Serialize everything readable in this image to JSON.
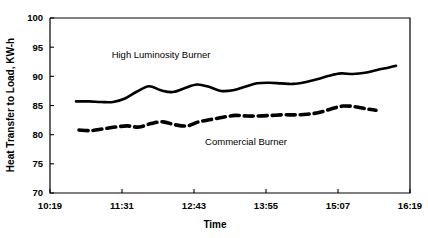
{
  "chart_data": {
    "type": "line",
    "title": "",
    "xlabel": "Time",
    "ylabel": "Heat Transfer to Load, KW-h",
    "ylim": [
      70,
      100
    ],
    "yticks": [
      70,
      75,
      80,
      85,
      90,
      95,
      100
    ],
    "ytick_labels": [
      "70",
      "75",
      "80",
      "85",
      "90",
      "95",
      "100"
    ],
    "xticks": [
      "10:19",
      "11:31",
      "12:43",
      "13:55",
      "15:07",
      "16:19"
    ],
    "xlim": [
      "10:19",
      "16:19"
    ],
    "grid": false,
    "legend_position": "inline-annotation",
    "series": [
      {
        "name": "High Luminosity Burner",
        "style": "solid",
        "color": "#000000",
        "label_x": "12:10",
        "label_y": 93.2,
        "x": [
          "10:45",
          "10:58",
          "11:10",
          "11:22",
          "11:34",
          "11:46",
          "11:58",
          "12:10",
          "12:22",
          "12:34",
          "12:46",
          "12:58",
          "13:10",
          "13:22",
          "13:34",
          "13:46",
          "13:58",
          "14:10",
          "14:22",
          "14:34",
          "14:46",
          "14:58",
          "15:10",
          "15:22",
          "15:34",
          "15:46",
          "15:58",
          "16:05"
        ],
        "values": [
          85.7,
          85.7,
          85.6,
          85.6,
          86.2,
          87.4,
          88.3,
          87.6,
          87.3,
          88.0,
          88.6,
          88.2,
          87.5,
          87.6,
          88.2,
          88.8,
          88.9,
          88.8,
          88.7,
          89.0,
          89.5,
          90.1,
          90.5,
          90.4,
          90.6,
          91.1,
          91.5,
          91.8
        ]
      },
      {
        "name": "Commercial Burner",
        "style": "dashed",
        "color": "#000000",
        "label_x": "13:35",
        "label_y": 78.3,
        "x": [
          "10:48",
          "11:00",
          "11:12",
          "11:24",
          "11:36",
          "11:48",
          "12:00",
          "12:12",
          "12:24",
          "12:36",
          "12:48",
          "13:00",
          "13:12",
          "13:24",
          "13:36",
          "13:48",
          "14:00",
          "14:12",
          "14:24",
          "14:36",
          "14:48",
          "15:00",
          "15:12",
          "15:24",
          "15:36",
          "15:45"
        ],
        "values": [
          80.8,
          80.7,
          81.0,
          81.3,
          81.5,
          81.3,
          81.9,
          82.2,
          81.7,
          81.5,
          82.2,
          82.6,
          83.0,
          83.3,
          83.2,
          83.2,
          83.3,
          83.4,
          83.4,
          83.5,
          83.8,
          84.4,
          84.9,
          84.8,
          84.4,
          84.2
        ]
      }
    ]
  },
  "figure": {
    "background_color": "#ffffff",
    "frame_color": "#000000"
  }
}
